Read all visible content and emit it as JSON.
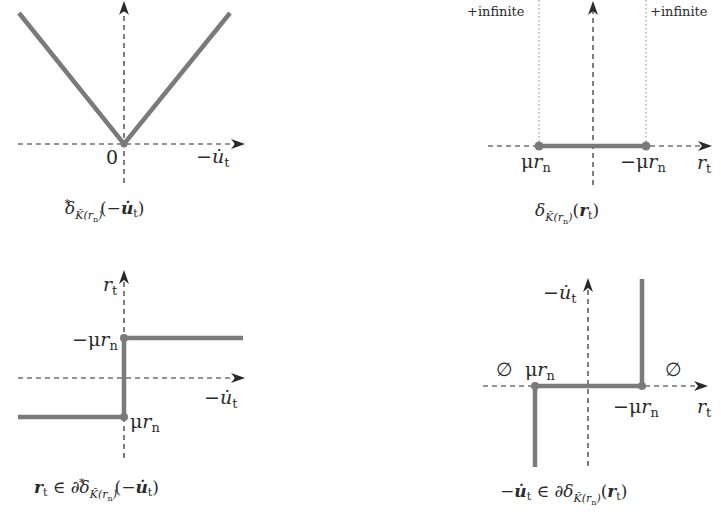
{
  "colors": {
    "curve": "#7a7a7a",
    "axis": "#2a2a2a",
    "guide": "#8a8a8a",
    "background": "#ffffff"
  },
  "panels": [
    {
      "id": "top-left",
      "caption": "δ*K̃(rn)(−u̇t)",
      "caption_parts": {
        "main": "δ",
        "sup": "*",
        "sub": "K̃(rn)",
        "arg": "(−u̇t)"
      },
      "x_axis_label": "−u̇t",
      "origin_label": "0",
      "description": "V-shaped absolute-value function with minimum at origin"
    },
    {
      "id": "top-right",
      "caption": "δK̃(rn)(rt)",
      "caption_parts": {
        "main": "δ",
        "sub": "K̃(rn)",
        "arg": "(rt)"
      },
      "x_axis_label": "rt",
      "left_point_label": "μrn",
      "right_point_label": "−μrn",
      "left_annotation": "+infinite",
      "right_annotation": "+infinite",
      "description": "Indicator function: zero between μrn and −μrn, +infinite outside"
    },
    {
      "id": "bottom-left",
      "caption": "rt ∈ ∂δ*K̃(rn)(−u̇t)",
      "caption_parts": {
        "lhs": "rt",
        "rel": "∈ ∂δ",
        "sup": "*",
        "sub": "K̃(rn)",
        "arg": "(−u̇t)"
      },
      "y_axis_label": "rt",
      "x_axis_label": "−u̇t",
      "upper_level_label": "−μrn",
      "lower_level_label": "μrn",
      "description": "Step (sign) set-valued map"
    },
    {
      "id": "bottom-right",
      "caption": "−u̇t ∈ ∂δK̃(rn)(rt)",
      "caption_parts": {
        "lhs": "−u̇t",
        "rel": "∈ ∂δ",
        "sub": "K̃(rn)",
        "arg": "(rt)"
      },
      "y_axis_label": "−u̇t",
      "x_axis_label": "rt",
      "left_point_label": "μrn",
      "right_point_label": "−μrn",
      "left_empty_label": "∅",
      "right_empty_label": "∅",
      "description": "Normal cone / inverse of the step map"
    }
  ]
}
